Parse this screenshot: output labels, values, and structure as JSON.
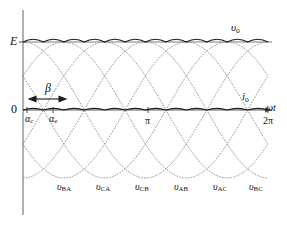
{
  "chart_data": {
    "type": "line",
    "title": "",
    "xlabel": "ωt",
    "ylabel": "",
    "grid": false,
    "legend": "inline-annotations",
    "xlim_deg": [
      0,
      360
    ],
    "ylim": [
      -1.0,
      1.15
    ],
    "axis": {
      "y_origin_label": "0",
      "y_peak_label": "E",
      "x_ticks": [
        {
          "value_deg": 180,
          "label": "π"
        },
        {
          "value_deg": 360,
          "label": "2π"
        }
      ]
    },
    "series": [
      {
        "name": "v_BA",
        "label_main": "υ",
        "label_sub": "BA",
        "phase_deg": 0,
        "type": "line-to-line-voltage",
        "style": "dotted"
      },
      {
        "name": "v_CA",
        "label_main": "υ",
        "label_sub": "CA",
        "phase_deg": 60,
        "type": "line-to-line-voltage",
        "style": "dotted"
      },
      {
        "name": "v_CB",
        "label_main": "υ",
        "label_sub": "CB",
        "phase_deg": 120,
        "type": "line-to-line-voltage",
        "style": "dotted"
      },
      {
        "name": "v_AB",
        "label_main": "υ",
        "label_sub": "AB",
        "phase_deg": 180,
        "type": "line-to-line-voltage",
        "style": "dotted"
      },
      {
        "name": "v_AC",
        "label_main": "υ",
        "label_sub": "AC",
        "phase_deg": 240,
        "type": "line-to-line-voltage",
        "style": "dotted"
      },
      {
        "name": "v_BC",
        "label_main": "υ",
        "label_sub": "BC",
        "phase_deg": 300,
        "type": "line-to-line-voltage",
        "style": "dotted"
      },
      {
        "name": "v_o",
        "label_main": "υ",
        "label_sub": "o",
        "type": "output-voltage-envelope",
        "style": "solid",
        "level": "E",
        "ripple_count": 12
      },
      {
        "name": "i_o",
        "label_main": "i",
        "label_sub": "o",
        "type": "output-current",
        "style": "solid",
        "level": "0",
        "ripple_count": 12
      }
    ],
    "annotations": [
      {
        "name": "firing-angle-alpha-c",
        "main": "α",
        "sub": "c",
        "at_deg": 6
      },
      {
        "name": "extinction-angle-alpha-e",
        "main": "α",
        "sub": "e",
        "at_deg": 44
      },
      {
        "name": "conduction-interval-beta",
        "main": "β",
        "sub": "",
        "span_deg": [
          6,
          44
        ],
        "arrow": "double-headed"
      }
    ]
  },
  "labels": {
    "peak_E": "E",
    "zero": "0",
    "omega_t": "ωt",
    "pi": "π",
    "two_pi": "2π",
    "beta": "β",
    "alpha_main": "α",
    "alpha_c_sub": "c",
    "alpha_e_sub": "e",
    "v_main": "υ",
    "i_main": "i",
    "vo_sub": "o",
    "io_sub": "o",
    "vba_sub": "BA",
    "vca_sub": "CA",
    "vcb_sub": "CB",
    "vab_sub": "AB",
    "vac_sub": "AC",
    "vbc_sub": "BC"
  },
  "colors": {
    "background": "#ffffff",
    "axis": "#6e6e6e",
    "waveform_dotted": "#8c8c8c",
    "waveform_solid": "#1a1a1a",
    "text": "#111111"
  }
}
